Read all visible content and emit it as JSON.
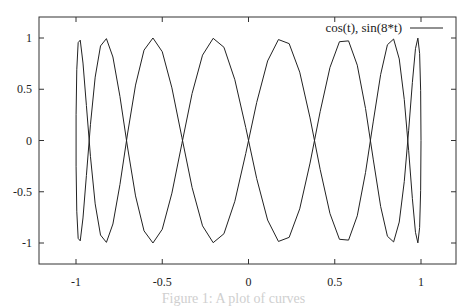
{
  "chart_data": {
    "type": "line",
    "title": "",
    "xlabel": "",
    "ylabel": "",
    "xlim": [
      -1.25,
      1.2
    ],
    "ylim": [
      -1.2,
      1.2
    ],
    "grid": false,
    "legend_position": "top-right inside",
    "x_ticks": [
      -1,
      -0.5,
      0,
      0.5,
      1
    ],
    "x_tick_labels": [
      "-1",
      "-0.5",
      "0",
      "0.5",
      "1"
    ],
    "y_ticks": [
      1,
      0.5,
      0,
      -0.5,
      -1
    ],
    "y_tick_labels": [
      "1",
      "0.5",
      "0",
      "-0.5",
      "-1"
    ],
    "series": [
      {
        "name": "cos(t), sin(8*t)",
        "kind": "parametric",
        "x_expr": "cos(t)",
        "y_expr": "sin(8*t)",
        "t_range": [
          0,
          6.283185307
        ],
        "samples": 100,
        "color": "#222222"
      }
    ]
  },
  "plot_frame": {
    "left": 39,
    "top": 17,
    "right": 456,
    "bottom": 264
  },
  "axis_mapping": {
    "x_px_at_minus1": 76,
    "x_px_at_plus1": 421,
    "y_px_at_plus1": 38,
    "y_px_at_minus1": 243
  },
  "legend": {
    "label": "cos(t), sin(8*t)"
  },
  "caption": {
    "text": "Figure 1: A plot of curves"
  }
}
